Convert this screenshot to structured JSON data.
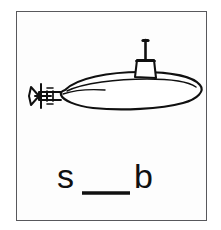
{
  "card": {
    "type": "phonics-flashcard",
    "frame_color": "#58585c",
    "background_color": "#ffffff",
    "ink_color": "#101010"
  },
  "illustration": {
    "subject": "submarine",
    "style": "black-and-white line drawing",
    "facing": "right",
    "parts": [
      {
        "name": "hull",
        "label": "hull"
      },
      {
        "name": "deck-line",
        "label": "deck line"
      },
      {
        "name": "conning-tower",
        "label": "conning tower"
      },
      {
        "name": "periscope",
        "label": "periscope"
      },
      {
        "name": "propeller",
        "label": "propeller"
      },
      {
        "name": "stern-planes",
        "label": "stern planes"
      },
      {
        "name": "propeller-shaft",
        "label": "propeller shaft"
      }
    ]
  },
  "puzzle": {
    "prompt_letters": [
      "s",
      "b"
    ],
    "first_letter": "s",
    "last_letter": "b",
    "blank": "___",
    "answer_length": 3,
    "full_text": "s ___ b",
    "blank_line_color": "#101010"
  }
}
